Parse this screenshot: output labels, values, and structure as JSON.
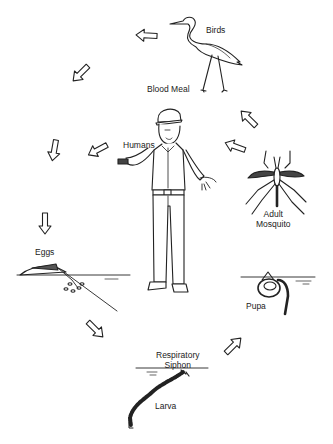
{
  "diagram": {
    "labels": {
      "birds": "Birds",
      "blood_meal": "Blood Meal",
      "humans": "Humans",
      "adult_line1": "Adult",
      "adult_line2": "Mosquito",
      "pupa": "Pupa",
      "siphon_line1": "Respiratory",
      "siphon_line2": "Siphon",
      "larva": "Larva",
      "eggs": "Eggs"
    },
    "stages": [
      "Eggs",
      "Larva",
      "Pupa",
      "Adult Mosquito",
      "Blood Meal (Birds / Humans)"
    ],
    "colors": {
      "line": "#222222",
      "background": "#ffffff"
    }
  }
}
